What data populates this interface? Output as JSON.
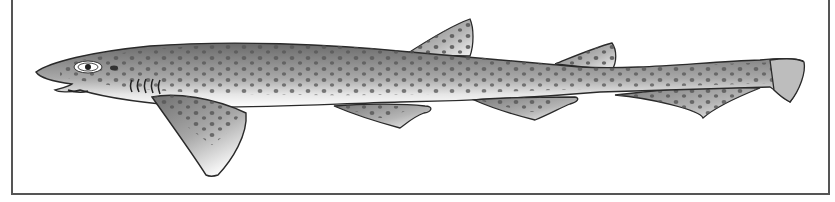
{
  "figure": {
    "colors": {
      "body_dark": "#6e6e6e",
      "body_light": "#f2f2f2",
      "spots": "#5a5a5a",
      "outline": "#2a2a2a",
      "frame": "#555555"
    }
  }
}
